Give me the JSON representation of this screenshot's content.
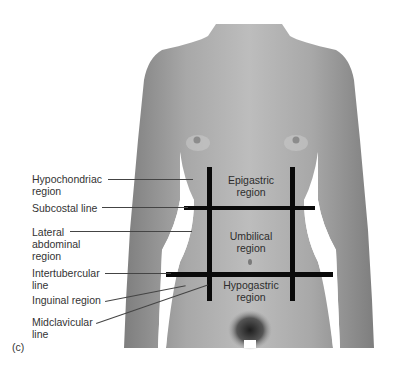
{
  "figure": {
    "panel_label": "(c)",
    "colors": {
      "skin_light": "#b4b4b4",
      "skin_dark": "#8a8a8a",
      "grid_line": "#0a0a0a",
      "text": "#333333"
    }
  },
  "regions": [
    {
      "name": "epigastric",
      "label": "Epigastric\nregion"
    },
    {
      "name": "umbilical",
      "label": "Umbilical\nregion"
    },
    {
      "name": "hypogastric",
      "label": "Hypogastric\nregion"
    }
  ],
  "labels": [
    {
      "name": "hypochondriac-region",
      "text": "Hypochondriac\nregion"
    },
    {
      "name": "subcostal-line",
      "text": "Subcostal line"
    },
    {
      "name": "lateral-abdominal-region",
      "text": "Lateral\nabdominal\nregion"
    },
    {
      "name": "intertubercular-line",
      "text": "Intertubercular\nline"
    },
    {
      "name": "inguinal-region",
      "text": "Inguinal region"
    },
    {
      "name": "midclavicular-line",
      "text": "Midclavicular\nline"
    }
  ]
}
